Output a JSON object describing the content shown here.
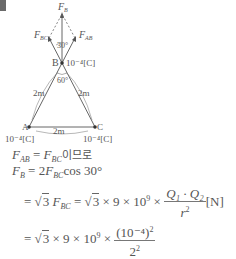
{
  "diagram": {
    "labels": {
      "fb": "F",
      "fb_sub": "B",
      "fbc": "F",
      "fbc_sub": "BC",
      "fab": "F",
      "fab_sub": "AB",
      "angle_top": "30°",
      "angle_b": "60°",
      "point_b": "B",
      "charge_b": "10⁻⁴[C]",
      "side_left": "2m",
      "side_right": "2m",
      "side_bottom": "2m",
      "point_a": "A",
      "point_c": "C",
      "charge_a": "10⁻⁴[C]",
      "charge_c": "10⁻⁴[C]"
    }
  },
  "solution": {
    "line1": {
      "lhs": "F",
      "lhs_sub": "AB",
      "eq": " = ",
      "rhs": "F",
      "rhs_sub": "BC",
      "suffix": "이므로"
    },
    "line2": {
      "lhs": "F",
      "lhs_sub": "B",
      "eq": " = 2",
      "rhs": "F",
      "rhs_sub": "BC",
      "suffix": "cos 30°"
    },
    "line3": {
      "prefix": "= ",
      "root": "3",
      "f": "F",
      "f_sub": "BC",
      "mid": " = ",
      "root2": "3",
      "times": " × 9 × 10",
      "exp": "9",
      "times2": " × ",
      "num": "Q₁ · Q₂",
      "den": "r",
      "den_exp": "2",
      "unit": "[N]"
    },
    "line4": {
      "prefix": "= ",
      "root": "3",
      "times": " × 9 × 10",
      "exp": "9",
      "times2": " × ",
      "num": "(10⁻⁴)",
      "num_exp": "2",
      "den": "2",
      "den_exp": "2"
    }
  }
}
